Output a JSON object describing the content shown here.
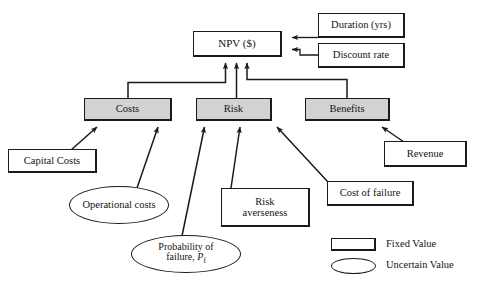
{
  "diagram": {
    "background_color": "#ffffff",
    "shaded_fill": "#d2d2d2",
    "line_color": "#1a1a1a",
    "nodes": {
      "npv": {
        "label": "NPV ($)",
        "shape": "box",
        "style": "fixed"
      },
      "duration": {
        "label": "Duration (yrs)",
        "shape": "box",
        "style": "fixed"
      },
      "discount_rate": {
        "label": "Discount rate",
        "shape": "box",
        "style": "fixed"
      },
      "costs": {
        "label": "Costs",
        "shape": "box",
        "style": "shaded"
      },
      "risk": {
        "label": "Risk",
        "shape": "box",
        "style": "shaded"
      },
      "benefits": {
        "label": "Benefits",
        "shape": "box",
        "style": "shaded"
      },
      "capital_costs": {
        "label": "Capital Costs",
        "shape": "box",
        "style": "fixed"
      },
      "operational_costs": {
        "label": "Operational costs",
        "shape": "ellipse",
        "style": "uncertain"
      },
      "probability_of_failure": {
        "label_line1": "Probability of",
        "label_line2_prefix": "failure, ",
        "label_symbol": "P",
        "label_subscript": "f",
        "shape": "ellipse",
        "style": "uncertain"
      },
      "risk_averseness": {
        "label_line1": "Risk",
        "label_line2": "averseness",
        "shape": "box",
        "style": "fixed"
      },
      "cost_of_failure": {
        "label": "Cost of failure",
        "shape": "box",
        "style": "fixed"
      },
      "revenue": {
        "label": "Revenue",
        "shape": "box",
        "style": "fixed"
      }
    },
    "legend": {
      "fixed_label": "Fixed Value",
      "uncertain_label": "Uncertain Value"
    }
  }
}
